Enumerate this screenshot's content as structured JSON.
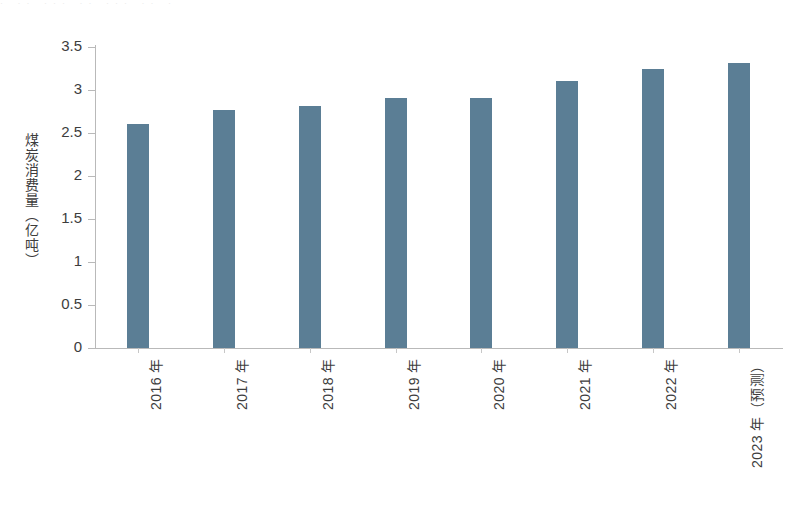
{
  "top_strip": {
    "text": "· ·· ··· ·· ··· ·· ·"
  },
  "chart_data": {
    "type": "bar",
    "title": "",
    "xlabel": "",
    "ylabel": "煤炭消费量（亿吨）",
    "categories": [
      "2016 年",
      "2017 年",
      "2018 年",
      "2019 年",
      "2020 年",
      "2021 年",
      "2022 年",
      "2023 年（预测）"
    ],
    "values": [
      2.6,
      2.77,
      2.81,
      2.91,
      2.91,
      3.11,
      3.24,
      3.31
    ],
    "ylim": [
      0,
      3.5
    ],
    "ytick_labels": [
      "0",
      "0.5",
      "1",
      "1.5",
      "2",
      "2.5",
      "3",
      "3.5"
    ],
    "ytick_values": [
      0,
      0.5,
      1,
      1.5,
      2,
      2.5,
      3,
      3.5
    ],
    "grid": false,
    "legend": null,
    "series_color": "#5b7e95",
    "axis_color": "#b9b9b9"
  }
}
